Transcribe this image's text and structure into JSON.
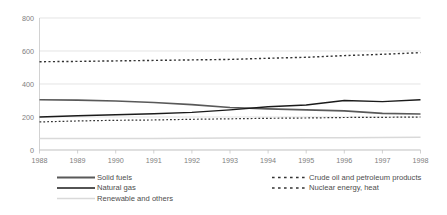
{
  "chart_data": {
    "type": "line",
    "title": "",
    "xlabel": "",
    "ylabel": "",
    "grid": true,
    "legend_position": "bottom",
    "ylim": [
      0,
      800
    ],
    "yticks": [
      0,
      200,
      400,
      600,
      800
    ],
    "x": [
      1988,
      1989,
      1990,
      1991,
      1992,
      1993,
      1994,
      1995,
      1996,
      1997,
      1998
    ],
    "categories": [
      "1988",
      "1989",
      "1990",
      "1991",
      "1992",
      "1993",
      "1994",
      "1995",
      "1996",
      "1997",
      "1998"
    ],
    "series": [
      {
        "name": "Solid fuels",
        "style": "solid",
        "color": "#595959",
        "width": 1.6,
        "values": [
          305,
          302,
          297,
          288,
          275,
          258,
          249,
          243,
          237,
          222,
          218
        ]
      },
      {
        "name": "Natural gas",
        "style": "solid",
        "color": "#1a1a1a",
        "width": 1.4,
        "values": [
          200,
          208,
          214,
          220,
          228,
          243,
          262,
          273,
          300,
          293,
          305
        ]
      },
      {
        "name": "Renewable and others",
        "style": "solid",
        "color": "#d9d9d9",
        "width": 1.5,
        "values": [
          70,
          70,
          70,
          70,
          71,
          72,
          73,
          74,
          75,
          76,
          78
        ]
      },
      {
        "name": "Crude oil and petroleum products",
        "style": "dashed",
        "color": "#333333",
        "width": 1.4,
        "values": [
          535,
          537,
          540,
          543,
          546,
          549,
          556,
          562,
          572,
          580,
          590
        ]
      },
      {
        "name": "Nuclear energy, heat",
        "style": "dashed",
        "color": "#333333",
        "width": 1.2,
        "values": [
          170,
          176,
          180,
          182,
          186,
          189,
          192,
          194,
          197,
          198,
          200
        ]
      }
    ]
  },
  "axis": {
    "y_labels": [
      "800",
      "600",
      "400",
      "200",
      "0"
    ],
    "x_labels": [
      "1988",
      "1989",
      "1990",
      "1991",
      "1992",
      "1993",
      "1994",
      "1995",
      "1996",
      "1997",
      "1998"
    ]
  },
  "legend": {
    "column_left": [
      {
        "label": "Solid fuels",
        "color": "#595959",
        "style": "solid",
        "width": 1.8
      },
      {
        "label": "Natural gas",
        "color": "#1a1a1a",
        "style": "solid",
        "width": 1.6
      },
      {
        "label": "Renewable and others",
        "color": "#d9d9d9",
        "style": "solid",
        "width": 1.6
      }
    ],
    "column_right": [
      {
        "label": "Crude oil and petroleum products",
        "color": "#333333",
        "style": "dashed",
        "width": 1.5
      },
      {
        "label": "Nuclear energy, heat",
        "color": "#333333",
        "style": "dashed",
        "width": 1.4
      }
    ]
  }
}
